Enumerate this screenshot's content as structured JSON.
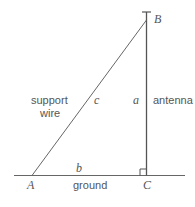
{
  "diagram": {
    "type": "right-triangle",
    "vertices": {
      "A": "A",
      "B": "B",
      "C": "C"
    },
    "sides": {
      "a": "a",
      "b": "b",
      "c": "c"
    },
    "labels": {
      "support_wire_line1": "support",
      "support_wire_line2": "wire",
      "antenna": "antenna",
      "ground": "ground"
    },
    "right_angle_at": "C",
    "colors": {
      "line": "#666666",
      "text": "#555555"
    }
  }
}
